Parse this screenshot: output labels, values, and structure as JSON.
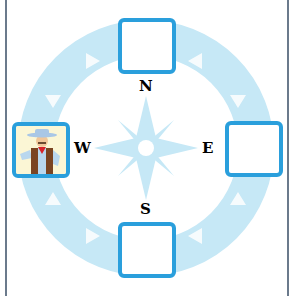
{
  "diagram": {
    "type": "compass",
    "colors": {
      "ring": "#c6e8f6",
      "star": "#c6e8f6",
      "slot_border": "#2a9fdc",
      "frame": "#6b7a8c",
      "label": "#000000"
    },
    "directions": [
      {
        "key": "north",
        "label": "N",
        "slot_content": "empty"
      },
      {
        "key": "east",
        "label": "E",
        "slot_content": "empty"
      },
      {
        "key": "south",
        "label": "S",
        "slot_content": "empty"
      },
      {
        "key": "west",
        "label": "W",
        "slot_content": "cowboy-character"
      }
    ],
    "ring_arrows": "counter-clockwise"
  }
}
